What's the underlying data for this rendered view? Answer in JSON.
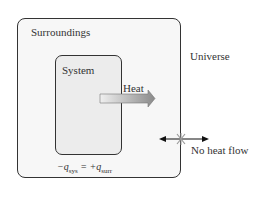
{
  "diagram": {
    "surroundings_label": "Surroundings",
    "system_label": "System",
    "universe_label": "Universe",
    "heat_label": "Heat",
    "no_heat_flow_label": "No heat flow",
    "formula": {
      "lhs_sign": "−q",
      "lhs_sub": "sys",
      "equals": " = ",
      "rhs_sign": "+q",
      "rhs_sub": "surr"
    },
    "colors": {
      "outer_fill": "#f7f7f7",
      "inner_fill": "#ececec",
      "border": "#333333",
      "cross": "#999999"
    }
  }
}
